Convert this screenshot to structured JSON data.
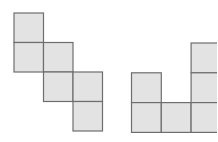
{
  "figures": [
    {
      "name": "staircase-net",
      "cells": [
        [
          0,
          0
        ],
        [
          0,
          1
        ],
        [
          1,
          1
        ],
        [
          1,
          2
        ],
        [
          2,
          2
        ],
        [
          2,
          3
        ]
      ]
    },
    {
      "name": "u-shape-net",
      "cells": [
        [
          0,
          1
        ],
        [
          0,
          2
        ],
        [
          1,
          2
        ],
        [
          2,
          0
        ],
        [
          2,
          1
        ],
        [
          2,
          2
        ]
      ]
    }
  ],
  "colors": {
    "fill": "#e3e3e3",
    "stroke": "#6e6e6e"
  }
}
